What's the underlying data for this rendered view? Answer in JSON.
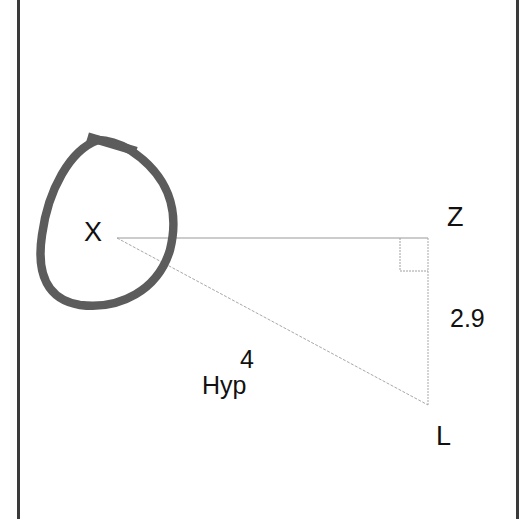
{
  "diagram": {
    "type": "right-triangle",
    "vertices": {
      "X": {
        "label": "X"
      },
      "Z": {
        "label": "Z"
      },
      "L": {
        "label": "L"
      }
    },
    "sides": {
      "opposite": {
        "from": "Z",
        "to": "L",
        "value": "2.9"
      },
      "hypotenuse": {
        "from": "X",
        "to": "L",
        "value": "4",
        "name": "Hyp"
      },
      "adjacent": {
        "from": "X",
        "to": "Z",
        "value": ""
      }
    },
    "right_angle_at": "Z",
    "highlighted_vertex": "X",
    "colors": {
      "lines": "#9a9a9a",
      "highlight_loop": "#5c5c5c",
      "text": "#111111",
      "frame": "#3a3a3a"
    }
  }
}
